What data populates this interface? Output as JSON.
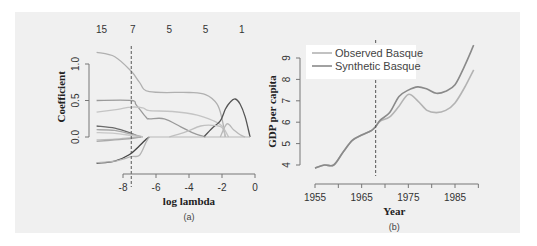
{
  "chart_data": [
    {
      "id": "a",
      "type": "line",
      "caption": "(a)",
      "title": "",
      "xlabel": "log lambda",
      "ylabel": "Coefficient",
      "xlim": [
        -9.6,
        0.2
      ],
      "ylim": [
        -0.4,
        1.2
      ],
      "xticks": [
        "-8",
        "-6",
        "-4",
        "-2",
        "0"
      ],
      "yticks": [
        "0.0",
        "0.5",
        "1.0"
      ],
      "top_axis_labels": [
        "15",
        "7",
        "5",
        "5",
        "1"
      ],
      "top_axis_positions": [
        -9.3,
        -7.4,
        -5.2,
        -3.0,
        -0.8
      ],
      "vertical_dashed_line_x": -7.5,
      "grid": false,
      "series": [
        {
          "name": "path-1",
          "color": "#b0b0b0",
          "x": [
            -9.6,
            -8.5,
            -7.5,
            -7.0,
            -6.4,
            -4,
            -3,
            -2.3,
            -2.0,
            -1.8
          ],
          "y": [
            1.16,
            1.1,
            0.9,
            0.75,
            0.62,
            0.61,
            0.58,
            0.45,
            0.25,
            0.0
          ]
        },
        {
          "name": "path-2",
          "color": "#9a9a9a",
          "x": [
            -9.6,
            -7.5,
            -7.2,
            -6.6,
            -6.4,
            -5.5,
            -4.5,
            -3.8,
            -3.0
          ],
          "y": [
            0.5,
            0.5,
            0.44,
            0.27,
            0.25,
            0.25,
            0.14,
            0.06,
            0.0
          ]
        },
        {
          "name": "path-3",
          "color": "#c4c4c4",
          "x": [
            -9.6,
            -8.3,
            -7.5,
            -6.8,
            -6.4,
            -5,
            -3.5,
            -2.5,
            -2.0,
            -1.6
          ],
          "y": [
            0.34,
            0.38,
            0.41,
            0.4,
            0.36,
            0.35,
            0.3,
            0.22,
            0.15,
            0.0
          ]
        },
        {
          "name": "path-4",
          "color": "#555555",
          "x": [
            -3.1,
            -2.6,
            -2.1,
            -1.8,
            -1.5,
            -1.2,
            -0.9,
            -0.6,
            -0.3
          ],
          "y": [
            0.0,
            0.12,
            0.22,
            0.38,
            0.48,
            0.52,
            0.45,
            0.28,
            0.0
          ]
        },
        {
          "name": "path-5",
          "color": "#c0c0c0",
          "x": [
            -5.2,
            -4.2,
            -3.3,
            -2.6,
            -2.0,
            -1.8
          ],
          "y": [
            0.0,
            0.07,
            0.15,
            0.16,
            0.13,
            0.0
          ]
        },
        {
          "name": "path-6",
          "color": "#b8b8b8",
          "x": [
            -2.1,
            -1.7,
            -1.3,
            -0.9,
            -0.6
          ],
          "y": [
            0.0,
            0.18,
            0.1,
            0.03,
            0.0
          ]
        },
        {
          "name": "path-7",
          "color": "#6a6a6a",
          "x": [
            -9.6,
            -8.5,
            -7.5,
            -7.0
          ],
          "y": [
            0.15,
            0.12,
            0.05,
            0.0
          ]
        },
        {
          "name": "path-8",
          "color": "#a8a8a8",
          "x": [
            -9.6,
            -8.5,
            -7.5,
            -6.8
          ],
          "y": [
            0.1,
            0.09,
            0.04,
            0.0
          ]
        },
        {
          "name": "path-9",
          "color": "#c8c8c8",
          "x": [
            -9.6,
            -8.5,
            -7.5,
            -6.8
          ],
          "y": [
            0.06,
            0.05,
            0.02,
            0.0
          ]
        },
        {
          "name": "path-10",
          "color": "#bdbdbd",
          "x": [
            -9.6,
            -8.5,
            -7.5,
            -6.9
          ],
          "y": [
            -0.04,
            -0.03,
            -0.01,
            0.0
          ]
        },
        {
          "name": "path-11",
          "color": "#aaaaaa",
          "x": [
            -9.6,
            -8.5,
            -7.5,
            -6.9
          ],
          "y": [
            -0.06,
            -0.04,
            -0.02,
            0.0
          ]
        },
        {
          "name": "path-12",
          "color": "#444444",
          "x": [
            -9.6,
            -8.5,
            -7.6,
            -7.0,
            -6.6,
            -6.4
          ],
          "y": [
            -0.36,
            -0.33,
            -0.24,
            -0.12,
            -0.03,
            0.0
          ]
        },
        {
          "name": "path-13",
          "color": "#b5b5b5",
          "x": [
            -9.6,
            -8.5,
            -7.5,
            -7.0,
            -6.6,
            -6.4
          ],
          "y": [
            -0.35,
            -0.33,
            -0.27,
            -0.25,
            -0.07,
            0.0
          ]
        }
      ]
    },
    {
      "id": "b",
      "type": "line",
      "caption": "(b)",
      "title": "",
      "xlabel": "Year",
      "ylabel": "GDP per capita",
      "xlim": [
        1955,
        1997
      ],
      "ylim": [
        3.8,
        9.8
      ],
      "xticks": [
        "1955",
        "1965",
        "1975",
        "1985"
      ],
      "yticks": [
        "4",
        "5",
        "6",
        "7",
        "8",
        "9"
      ],
      "vertical_dashed_line_x": 1968,
      "legend_position": "top-left",
      "grid": false,
      "series": [
        {
          "name": "Observed Basque",
          "color": "#b3b3b3",
          "x": [
            1955,
            1957,
            1959,
            1961,
            1963,
            1965,
            1967,
            1968,
            1969,
            1971,
            1973,
            1975,
            1977,
            1979,
            1981,
            1983,
            1985,
            1987,
            1989,
            1997
          ],
          "y": [
            3.85,
            4.0,
            4.0,
            4.6,
            5.15,
            5.4,
            5.6,
            5.8,
            6.05,
            6.25,
            6.75,
            7.3,
            7.0,
            6.55,
            6.45,
            6.55,
            6.9,
            7.6,
            8.45,
            8.45
          ]
        },
        {
          "name": "Synthetic Basque",
          "color": "#8a8a8a",
          "x": [
            1955,
            1957,
            1959,
            1961,
            1963,
            1965,
            1967,
            1968,
            1969,
            1971,
            1973,
            1975,
            1977,
            1979,
            1981,
            1983,
            1985,
            1987,
            1989,
            1997
          ],
          "y": [
            3.85,
            4.0,
            4.0,
            4.6,
            5.15,
            5.4,
            5.6,
            5.8,
            6.1,
            6.45,
            7.2,
            7.5,
            7.65,
            7.55,
            7.35,
            7.45,
            7.75,
            8.6,
            9.6,
            9.6
          ]
        }
      ]
    }
  ]
}
